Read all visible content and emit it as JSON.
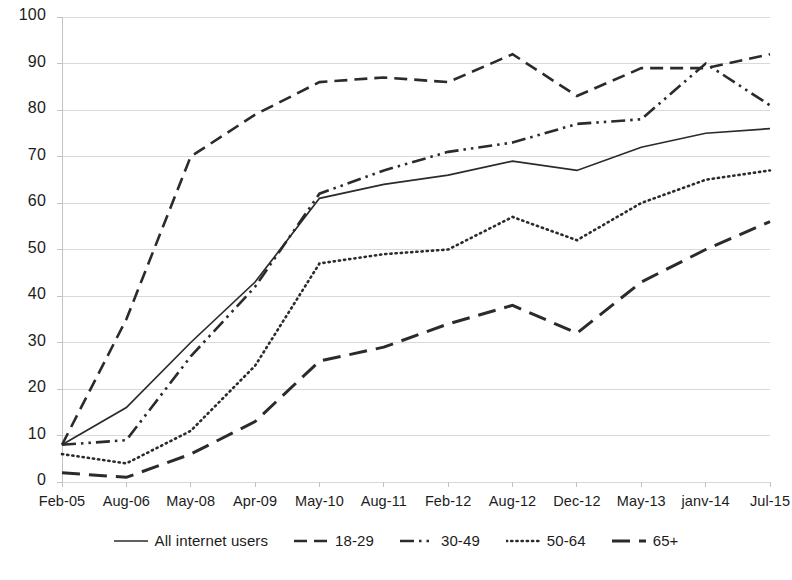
{
  "chart_data": {
    "type": "line",
    "title": "",
    "subtitle": "",
    "xlabel": "",
    "ylabel": "",
    "categories": [
      "Feb-05",
      "Aug-06",
      "May-08",
      "Apr-09",
      "May-10",
      "Aug-11",
      "Feb-12",
      "Aug-12",
      "Dec-12",
      "May-13",
      "janv-14",
      "Jul-15"
    ],
    "ylim": [
      0,
      100
    ],
    "ytick_labels": [
      "0",
      "10",
      "20",
      "30",
      "40",
      "50",
      "60",
      "70",
      "80",
      "90",
      "100"
    ],
    "ytick_values": [
      0,
      10,
      20,
      30,
      40,
      50,
      60,
      70,
      80,
      90,
      100
    ],
    "grid": "horizontal",
    "legend_position": "bottom",
    "series": [
      {
        "name": "All internet users",
        "style": "solid",
        "color": "#2b2b2b",
        "values": [
          8,
          16,
          30,
          43,
          61,
          64,
          66,
          69,
          67,
          72,
          75,
          76
        ]
      },
      {
        "name": "18-29",
        "style": "dashed",
        "color": "#2b2b2b",
        "values": [
          8,
          35,
          70,
          79,
          86,
          87,
          86,
          92,
          83,
          89,
          89,
          92
        ]
      },
      {
        "name": "30-49",
        "style": "dash-dot-dot",
        "color": "#2b2b2b",
        "values": [
          8,
          9,
          27,
          42,
          62,
          67,
          71,
          73,
          77,
          78,
          90,
          81
        ]
      },
      {
        "name": "50-64",
        "style": "dotted",
        "color": "#2b2b2b",
        "values": [
          6,
          4,
          11,
          25,
          47,
          49,
          50,
          57,
          52,
          60,
          65,
          67
        ]
      },
      {
        "name": "65+",
        "style": "long-dash",
        "color": "#2b2b2b",
        "values": [
          2,
          1,
          6,
          13,
          26,
          29,
          34,
          38,
          32,
          43,
          50,
          56
        ]
      }
    ]
  },
  "legend": {
    "items": [
      {
        "label": "All internet users"
      },
      {
        "label": "18-29"
      },
      {
        "label": "30-49"
      },
      {
        "label": "50-64"
      },
      {
        "label": "65+"
      }
    ]
  }
}
